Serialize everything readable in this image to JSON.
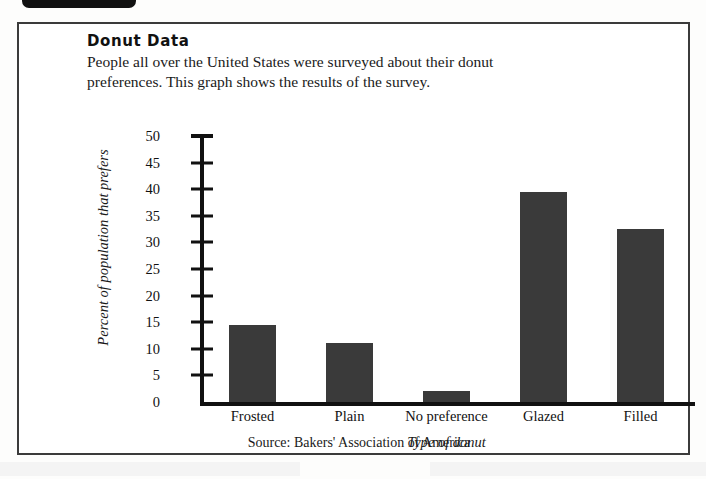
{
  "document": {
    "title": "Donut Data",
    "intro": "People all over the United States were surveyed about their donut preferences. This graph shows the results of the survey.",
    "source": "Source: Bakers' Association of America"
  },
  "chart_data": {
    "type": "bar",
    "title": "Donut Data",
    "categories": [
      "Frosted",
      "Plain",
      "No preference",
      "Glazed",
      "Filled"
    ],
    "values": [
      14.5,
      11,
      2,
      39.5,
      32.5
    ],
    "xlabel": "Type of donut",
    "ylabel": "Percent of population that prefers",
    "ylim": [
      0,
      50
    ],
    "ytick_labels": [
      "50",
      "45",
      "40",
      "35",
      "30",
      "25",
      "20",
      "15",
      "10",
      "5",
      "0"
    ],
    "ytick_values": [
      50,
      45,
      40,
      35,
      30,
      25,
      20,
      15,
      10,
      5,
      0
    ],
    "ytick_step": 5,
    "grid": false,
    "legend": "none",
    "bar_color": "#3a3a3a",
    "axis_color": "#111111"
  },
  "colors": {
    "bar": "#3a3a3a",
    "axis": "#111111",
    "border": "#3b3b3b",
    "page": "#fdfdfc",
    "tab": "#111111"
  }
}
